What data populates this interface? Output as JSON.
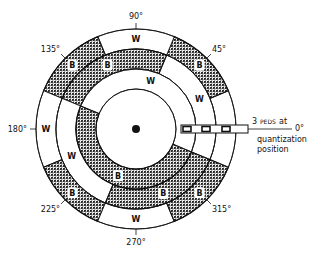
{
  "figure": {
    "type": "encoder-disk-diagram",
    "tracks": [
      {
        "name": "outer",
        "segments": [
          {
            "from": 337.5,
            "to": 22.5,
            "color": "W"
          },
          {
            "from": 22.5,
            "to": 67.5,
            "color": "B"
          },
          {
            "from": 67.5,
            "to": 112.5,
            "color": "W"
          },
          {
            "from": 112.5,
            "to": 157.5,
            "color": "B"
          },
          {
            "from": 157.5,
            "to": 202.5,
            "color": "W"
          },
          {
            "from": 202.5,
            "to": 247.5,
            "color": "B"
          },
          {
            "from": 247.5,
            "to": 292.5,
            "color": "W"
          },
          {
            "from": 292.5,
            "to": 337.5,
            "color": "B"
          }
        ],
        "labels": [
          {
            "angle": 0,
            "text": "W"
          },
          {
            "angle": 45,
            "text": "B"
          },
          {
            "angle": 90,
            "text": "W"
          },
          {
            "angle": 135,
            "text": "B"
          },
          {
            "angle": 180,
            "text": "W"
          },
          {
            "angle": 225,
            "text": "B"
          },
          {
            "angle": 270,
            "text": "W"
          },
          {
            "angle": 315,
            "text": "B"
          }
        ]
      },
      {
        "name": "middle",
        "segments": [
          {
            "from": 337.5,
            "to": 67.5,
            "color": "W"
          },
          {
            "from": 67.5,
            "to": 157.5,
            "color": "B"
          },
          {
            "from": 157.5,
            "to": 247.5,
            "color": "W"
          },
          {
            "from": 247.5,
            "to": 337.5,
            "color": "B"
          }
        ],
        "labels": [
          {
            "angle": 25,
            "text": "W"
          },
          {
            "angle": 114,
            "text": "B"
          },
          {
            "angle": 203,
            "text": "W"
          },
          {
            "angle": 293,
            "text": "B"
          }
        ]
      },
      {
        "name": "inner",
        "segments": [
          {
            "from": 337.5,
            "to": 157.5,
            "color": "W"
          },
          {
            "from": 157.5,
            "to": 337.5,
            "color": "B"
          }
        ],
        "labels": [
          {
            "angle": 73,
            "text": "W"
          },
          {
            "angle": 249,
            "text": "B"
          }
        ]
      }
    ],
    "angle_markers": [
      {
        "angle": 90,
        "text": "90°"
      },
      {
        "angle": 45,
        "text": "45°"
      },
      {
        "angle": 135,
        "text": "135°"
      },
      {
        "angle": 180,
        "text": "180°"
      },
      {
        "angle": 225,
        "text": "225°"
      },
      {
        "angle": 270,
        "text": "270°"
      },
      {
        "angle": 315,
        "text": "315°"
      }
    ],
    "peds": {
      "count": 3,
      "count_label": "3",
      "label_small": "PEDS",
      "label_rest": "at",
      "zero_label": "0°",
      "line2": "quantization",
      "line3": "position"
    },
    "colors": {
      "black_segment": "#3a3a3a",
      "line": "#111111",
      "white": "#ffffff"
    }
  }
}
